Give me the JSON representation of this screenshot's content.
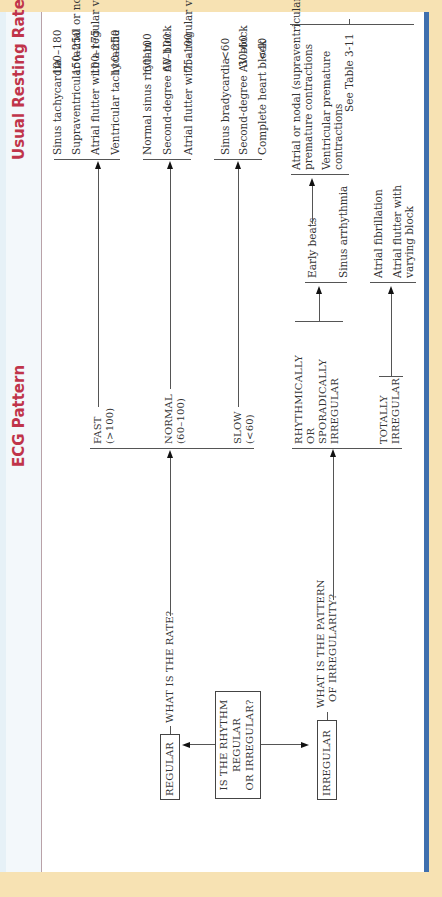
{
  "header": {
    "ecg_pattern": "ECG Pattern",
    "usual_resting_rate": "Usual Resting Rate"
  },
  "root_question": [
    "IS THE RHYTHM",
    "REGULAR",
    "OR IRREGULAR?"
  ],
  "regular": {
    "label": "REGULAR",
    "question": "WHAT IS THE RATE?",
    "branches": [
      {
        "label": [
          "FAST",
          "(>100)"
        ],
        "diagnoses": [
          {
            "name": "Sinus tachycardia",
            "rate": "100–180"
          },
          {
            "name": "Supraventricular (atrial or nodal) tachycardia",
            "rate": "150–250"
          },
          {
            "name": "Atrial flutter with a regular ventricular response",
            "rate": "100–175"
          },
          {
            "name": "Ventricular tachycardia",
            "rate": "110–250"
          }
        ]
      },
      {
        "label": [
          "NORMAL",
          "(60–100)"
        ],
        "diagnoses": [
          {
            "name": "Normal sinus rhythm",
            "rate": "60–100"
          },
          {
            "name": "Second-degree AV block",
            "rate": "60–100"
          },
          {
            "name": "Atrial flutter with a regular ventricular response",
            "rate": "75–100"
          }
        ]
      },
      {
        "label": [
          "SLOW",
          "(<60)"
        ],
        "diagnoses": [
          {
            "name": "Sinus bradycardia",
            "rate": "<60"
          },
          {
            "name": "Second-degree AV block",
            "rate": "30–60"
          },
          {
            "name": "Complete heart block",
            "rate": "<40"
          }
        ]
      }
    ]
  },
  "irregular": {
    "label": "IRREGULAR",
    "question": [
      "WHAT IS THE PATTERN",
      "OF IRREGULARITY?"
    ],
    "branches": [
      {
        "label": [
          "RHYTHMICALLY",
          "OR",
          "SPORADICALLY",
          "IRREGULAR"
        ],
        "items": [
          "Early beats",
          "Sinus arrhythmia"
        ],
        "early_beats_types": [
          [
            "Atrial or nodal (supraventricular)",
            "premature contractions"
          ],
          [
            "Ventricular premature",
            "contractions"
          ]
        ]
      },
      {
        "label": [
          "TOTALLY",
          "IRREGULAR"
        ],
        "items": [
          [
            "Atrial fibrillation"
          ],
          [
            "Atrial flutter with",
            "varying block"
          ]
        ]
      }
    ],
    "see_table": "See Table 3-11"
  },
  "colors": {
    "header_text": "#c0344a",
    "accent_bar": "#3f6fae",
    "page_background": "#f7e2b3"
  }
}
